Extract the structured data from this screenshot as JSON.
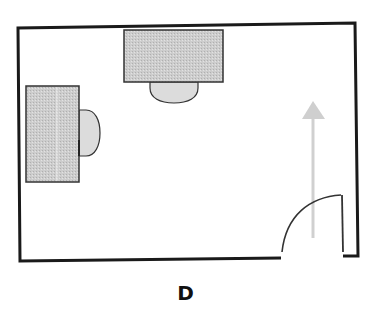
{
  "diagram": {
    "type": "floor-plan",
    "label": "D",
    "elements": [
      {
        "name": "room-walls",
        "kind": "rectangular room outline"
      },
      {
        "name": "desk-top",
        "kind": "desk",
        "position": "top wall, center-left"
      },
      {
        "name": "chair-top",
        "kind": "chair",
        "position": "below top desk"
      },
      {
        "name": "desk-left",
        "kind": "desk",
        "position": "left wall"
      },
      {
        "name": "chair-left",
        "kind": "chair",
        "position": "right of left desk"
      },
      {
        "name": "door",
        "kind": "door with swing arc",
        "position": "bottom-right corner"
      },
      {
        "name": "entry-arrow",
        "kind": "arrow",
        "direction": "up",
        "position": "from door into room"
      }
    ]
  },
  "colors": {
    "wall": "#1a1a1a",
    "furniture_fill": "#c8c8c8",
    "chair_fill": "#dcdcdc",
    "arrow": "#cfcfcf"
  }
}
